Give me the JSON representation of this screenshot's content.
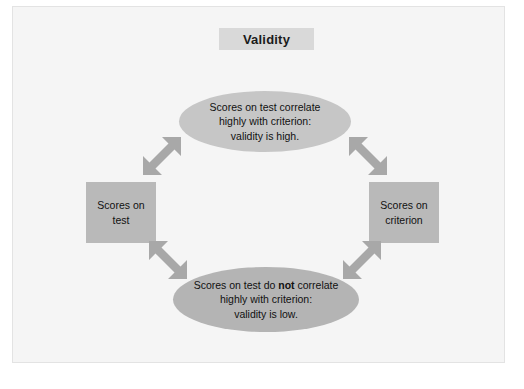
{
  "diagram": {
    "title": "Validity",
    "nodes": {
      "left_box": "Scores on test",
      "right_box": "Scores on criterion",
      "top_ellipse_line1": "Scores on test correlate",
      "top_ellipse_line2": "highly with criterion:",
      "top_ellipse_line3": "validity is high.",
      "bottom_ellipse_line1_a": "Scores on test do ",
      "bottom_ellipse_line1_bold": "not",
      "bottom_ellipse_line1_b": " correlate",
      "bottom_ellipse_line2": "highly with criterion:",
      "bottom_ellipse_line3": "validity is low."
    },
    "connectors": [
      {
        "name": "left-box-to-high-ellipse",
        "style": "double-headed-arrow",
        "direction": "up-right"
      },
      {
        "name": "high-ellipse-to-right-box",
        "style": "double-headed-arrow",
        "direction": "down-right"
      },
      {
        "name": "left-box-to-low-ellipse",
        "style": "double-headed-arrow",
        "direction": "down-right"
      },
      {
        "name": "low-ellipse-to-right-box",
        "style": "double-headed-arrow",
        "direction": "up-right"
      }
    ],
    "colors": {
      "canvas_background": "#f5f5f5",
      "title_band": "#d9d9d9",
      "ellipse_high": "#c6c6c6",
      "ellipse_low": "#b4b4b4",
      "box": "#b9b9b9",
      "arrow": "#a8a8a8",
      "text": "#111111"
    }
  }
}
